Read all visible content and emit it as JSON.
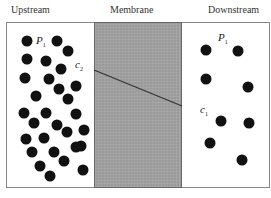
{
  "headers": {
    "upstream": "Upstream",
    "membrane": "Membrane",
    "downstream": "Downstream"
  },
  "labels": {
    "upstream_pressure": {
      "symbol": "P",
      "sub": "1"
    },
    "upstream_conc": {
      "symbol": "c",
      "sub": "2"
    },
    "downstream_pressure": {
      "symbol": "P",
      "sub": "1"
    },
    "downstream_conc": {
      "symbol": "c",
      "sub": "1"
    }
  },
  "colors": {
    "membrane_fill": "#9a9a9a",
    "particle": "#111111",
    "line": "#333333"
  },
  "particles": {
    "upstream": [
      [
        27,
        41
      ],
      [
        57,
        41
      ],
      [
        68,
        51
      ],
      [
        27,
        59
      ],
      [
        46,
        61
      ],
      [
        61,
        69
      ],
      [
        25,
        78
      ],
      [
        49,
        79
      ],
      [
        59,
        89
      ],
      [
        76,
        86
      ],
      [
        36,
        96
      ],
      [
        68,
        99
      ],
      [
        24,
        113
      ],
      [
        46,
        113
      ],
      [
        76,
        114
      ],
      [
        34,
        123
      ],
      [
        57,
        125
      ],
      [
        67,
        132
      ],
      [
        84,
        130
      ],
      [
        26,
        139
      ],
      [
        44,
        138
      ],
      [
        81,
        146
      ],
      [
        32,
        152
      ],
      [
        54,
        152
      ],
      [
        76,
        147
      ],
      [
        40,
        166
      ],
      [
        64,
        161
      ],
      [
        83,
        170
      ],
      [
        50,
        176
      ]
    ],
    "downstream": [
      [
        206,
        50
      ],
      [
        238,
        51
      ],
      [
        206,
        79
      ],
      [
        248,
        87
      ],
      [
        221,
        121
      ],
      [
        249,
        123
      ],
      [
        210,
        143
      ],
      [
        242,
        160
      ]
    ]
  },
  "concentration_profile": {
    "x1": 94,
    "y1": 70,
    "x2": 182,
    "y2": 106
  }
}
